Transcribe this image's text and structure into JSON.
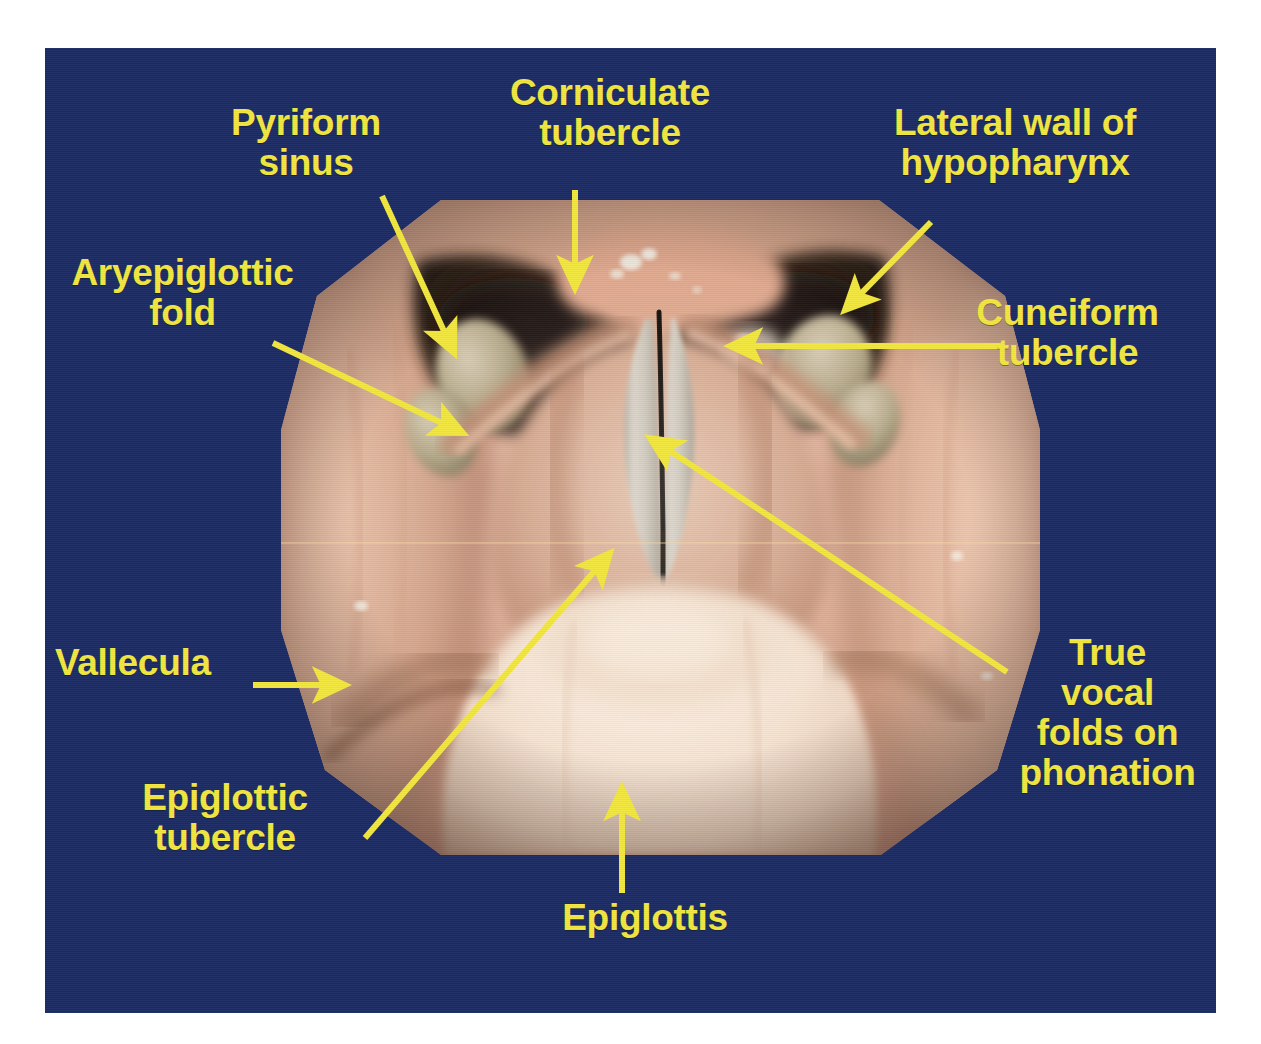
{
  "slide": {
    "background_color": "#1b2b63",
    "label_color": "#f2e73c",
    "subject": "Laryngoscopic view of the larynx and hypopharynx"
  },
  "labels": {
    "pyriform_sinus": "Pyriform\nsinus",
    "corniculate_tubercle": "Corniculate\ntubercle",
    "lateral_wall_hypopharynx": "Lateral wall of\nhypopharynx",
    "aryepiglottic_fold": "Aryepiglottic\nfold",
    "cuneiform_tubercle": "Cuneiform\ntubercle",
    "vallecula": "Vallecula",
    "epiglottic_tubercle": "Epiglottic\ntubercle",
    "true_vocal_folds": "True\nvocal\nfolds on\nphonation",
    "epiglottis": "Epiglottis"
  },
  "photo": {
    "type": "endoscopic-photograph",
    "description": "Indirect laryngoscopy photograph showing epiglottis, vallecula, aryepiglottic folds, pyriform sinuses, corniculate and cuneiform tubercles and adducted true vocal folds during phonation"
  }
}
